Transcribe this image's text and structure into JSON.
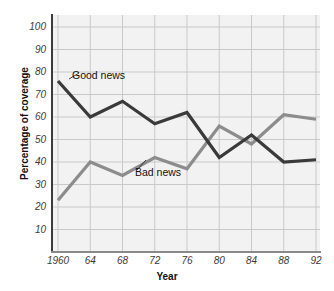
{
  "chart_data": {
    "type": "line",
    "title": "",
    "xlabel": "Year",
    "ylabel": "Percentage of coverage",
    "x": [
      1960,
      1964,
      1968,
      1972,
      1976,
      1980,
      1984,
      1988,
      1992
    ],
    "xtick_labels": [
      "1960",
      "64",
      "68",
      "72",
      "76",
      "80",
      "84",
      "88",
      "92"
    ],
    "ytick_labels": [
      "10",
      "20",
      "30",
      "40",
      "50",
      "60",
      "70",
      "80",
      "90",
      "100"
    ],
    "yticks": [
      10,
      20,
      30,
      40,
      50,
      60,
      70,
      80,
      90,
      100
    ],
    "ylim": [
      0,
      100
    ],
    "xlim": [
      1960,
      1992
    ],
    "grid": true,
    "legend_position": "inline-annotations",
    "series": [
      {
        "name": "Good news",
        "color": "#3a3a3a",
        "values": [
          76,
          60,
          67,
          57,
          62,
          42,
          52,
          40,
          41
        ]
      },
      {
        "name": "Bad news",
        "color": "#8c8c8c",
        "values": [
          23,
          40,
          34,
          42,
          37,
          56,
          48,
          61,
          59
        ]
      }
    ],
    "annotations": [
      {
        "label": "Good news",
        "series": "Good news"
      },
      {
        "label": "Bad news",
        "series": "Bad news"
      }
    ],
    "colors": {
      "plot_background": "#f2f2f2",
      "gridline": "#c9c9c9",
      "axis": "#3a3a3a",
      "good_news": "#3a3a3a",
      "bad_news": "#8c8c8c",
      "page_background": "#ffffff"
    }
  }
}
